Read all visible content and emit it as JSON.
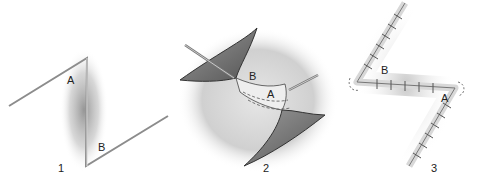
{
  "figure": {
    "panels": [
      {
        "number": "1",
        "labels": [
          "A",
          "B"
        ]
      },
      {
        "number": "2",
        "labels": [
          "B",
          "A"
        ]
      },
      {
        "number": "3",
        "labels": [
          "B",
          "A"
        ]
      }
    ]
  }
}
